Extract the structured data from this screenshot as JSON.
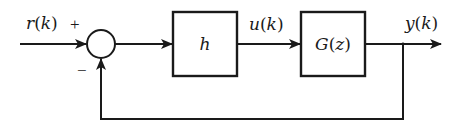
{
  "diagram": {
    "type": "feedback-control-block-diagram",
    "colors": {
      "stroke": "#1a1a1a",
      "background": "#ffffff"
    },
    "signals": {
      "input": {
        "name": "r",
        "arg": "k",
        "label": "r(k)"
      },
      "control": {
        "name": "u",
        "arg": "k",
        "label": "u(k)"
      },
      "output": {
        "name": "y",
        "arg": "k",
        "label": "y(k)"
      }
    },
    "summing_junction": {
      "plus_sign": "+",
      "minus_sign": "−"
    },
    "blocks": [
      {
        "id": "controller",
        "label": "h"
      },
      {
        "id": "plant",
        "label": "G(z)",
        "name": "G",
        "arg": "z"
      }
    ],
    "feedback": {
      "type": "unity negative feedback",
      "from": "y(k)",
      "to": "summing junction"
    }
  }
}
